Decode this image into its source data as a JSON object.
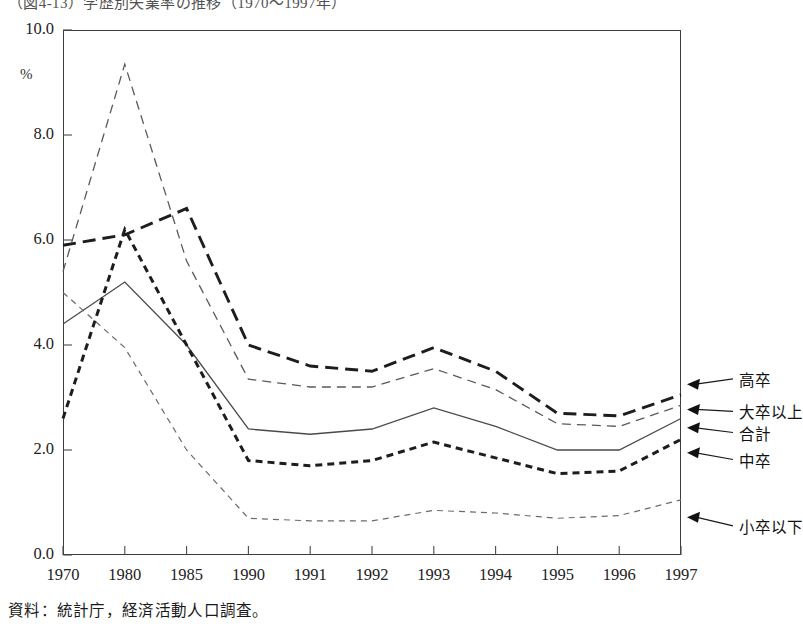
{
  "figure": {
    "title": "（図4-13）学歴別失業率の推移（1970～1997年）",
    "source_caption": "資料：統計庁，経済活動人口調査。"
  },
  "chart_data": {
    "type": "line",
    "title": "（図4-13）学歴別失業率の推移（1970～1997年）",
    "xlabel": "",
    "ylabel": "",
    "unit": "%",
    "grid": false,
    "legend_position": "right-inline-labels",
    "ylim": [
      0.0,
      10.0
    ],
    "ytick_values": [
      0.0,
      2.0,
      4.0,
      6.0,
      8.0,
      10.0
    ],
    "ytick_labels": [
      "0.0",
      "2.0",
      "4.0",
      "6.0",
      "8.0",
      "10.0"
    ],
    "categories": [
      "1970",
      "1980",
      "1985",
      "1990",
      "1991",
      "1992",
      "1993",
      "1994",
      "1995",
      "1996",
      "1997"
    ],
    "series": [
      {
        "name": "高卒",
        "style": "long-dash-thick",
        "values": [
          5.9,
          6.1,
          6.6,
          4.0,
          3.6,
          3.5,
          3.95,
          3.5,
          2.7,
          2.65,
          3.05
        ]
      },
      {
        "name": "大卒以上",
        "style": "fine-dash",
        "values": [
          5.4,
          9.35,
          5.6,
          3.35,
          3.2,
          3.2,
          3.55,
          3.15,
          2.5,
          2.45,
          2.85
        ]
      },
      {
        "name": "合計",
        "style": "solid-thin",
        "values": [
          4.4,
          5.2,
          4.0,
          2.4,
          2.3,
          2.4,
          2.8,
          2.45,
          2.0,
          2.0,
          2.6
        ]
      },
      {
        "name": "中卒",
        "style": "short-dash-thick",
        "values": [
          2.6,
          6.2,
          4.0,
          1.8,
          1.7,
          1.8,
          2.15,
          1.85,
          1.55,
          1.6,
          2.2
        ]
      },
      {
        "name": "小卒以下",
        "style": "dotted-fine",
        "values": [
          5.0,
          3.95,
          2.0,
          0.7,
          0.65,
          0.65,
          0.85,
          0.8,
          0.7,
          0.75,
          1.05
        ]
      }
    ]
  },
  "axis": {
    "unit_label": "%"
  }
}
